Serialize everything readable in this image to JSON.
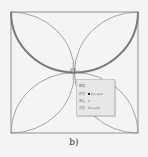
{
  "figure": {
    "caption": "b)",
    "square": {
      "x": 11,
      "y": 12,
      "width": 127,
      "height": 121,
      "stroke": "#8a8a8a"
    },
    "highlight_stroke": "#7a7a7a"
  },
  "tooltip": {
    "title": "圆弧",
    "rows": [
      {
        "label": "颜色",
        "value": "ByLayer",
        "swatch": "#222222"
      },
      {
        "label": "图层",
        "value": "0"
      },
      {
        "label": "线型",
        "value": "ByLayer"
      }
    ]
  }
}
